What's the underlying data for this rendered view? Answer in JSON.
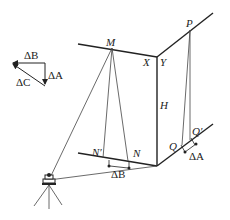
{
  "diagram": {
    "type": "surveying-geometry",
    "labels": {
      "M": "M",
      "X": "X",
      "Y": "Y",
      "P": "P",
      "H": "H",
      "N": "N",
      "N_prime": "N′",
      "Q": "Q",
      "Q_prime": "Q′",
      "delta_B_bottom": "ΔB",
      "delta_A_bottom": "ΔA"
    },
    "legend_triangle": {
      "delta_B": "ΔB",
      "delta_A": "ΔA",
      "delta_C": "ΔC"
    },
    "colors": {
      "line": "#222222",
      "thin_line": "#444444",
      "background": "#ffffff"
    }
  }
}
